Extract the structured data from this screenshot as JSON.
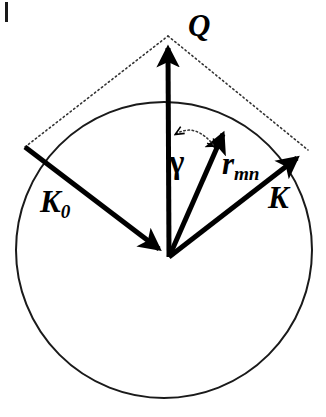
{
  "figure": {
    "kind": "vector-scattering-diagram",
    "background_color": "#ffffff",
    "stroke_color": "#000000",
    "width": 326,
    "height": 417
  },
  "labels": {
    "q": "Q",
    "k0_base": "K",
    "k0_sub": "0",
    "k": "K",
    "r_base": "r",
    "r_sub": "mn",
    "gamma": "γ"
  },
  "geometry": {
    "origin": {
      "x": 169,
      "y": 257
    },
    "ewald_circle": {
      "cx": 164,
      "cy": 250,
      "r": 148,
      "stroke_width": 2
    },
    "vectors": [
      {
        "name": "Q",
        "from": {
          "x": 169,
          "y": 257
        },
        "to": {
          "x": 168,
          "y": 36
        },
        "arrow_at": "head",
        "style": "solid",
        "stroke_width": 5
      },
      {
        "name": "K0",
        "from": {
          "x": 25,
          "y": 147
        },
        "to": {
          "x": 169,
          "y": 257
        },
        "arrow_at": "head",
        "style": "solid",
        "stroke_width": 5
      },
      {
        "name": "K",
        "from": {
          "x": 169,
          "y": 257
        },
        "to": {
          "x": 308,
          "y": 150
        },
        "arrow_at": "head",
        "style": "solid",
        "stroke_width": 5
      },
      {
        "name": "r_mn",
        "from": {
          "x": 169,
          "y": 257
        },
        "to": {
          "x": 228,
          "y": 121
        },
        "arrow_at": "head",
        "style": "solid",
        "stroke_width": 5
      }
    ],
    "construction_lines": [
      {
        "name": "dotted-left",
        "from": {
          "x": 25,
          "y": 147
        },
        "to": {
          "x": 168,
          "y": 36
        },
        "style": "dotted"
      },
      {
        "name": "dotted-right",
        "from": {
          "x": 168,
          "y": 36
        },
        "to": {
          "x": 308,
          "y": 150
        },
        "style": "dotted"
      }
    ],
    "angle_arc": {
      "name": "gamma",
      "between": [
        "Q",
        "r_mn"
      ],
      "style": "dotted",
      "double_headed": true,
      "start": {
        "x": 176,
        "y": 135
      },
      "end": {
        "x": 214,
        "y": 148
      }
    },
    "corner_tick": {
      "x": 5,
      "y": 2,
      "width": 3,
      "height": 20
    }
  }
}
